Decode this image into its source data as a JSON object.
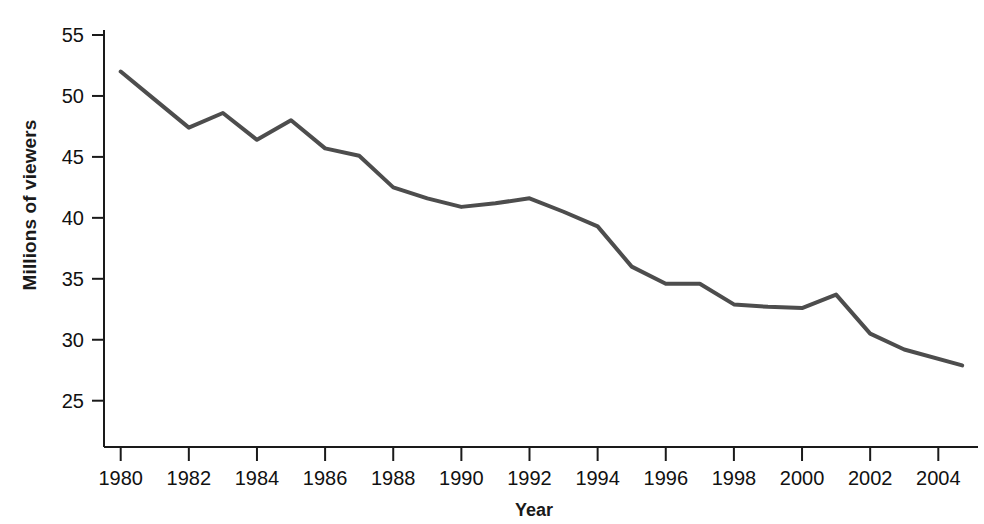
{
  "chart_data": {
    "type": "line",
    "title": "",
    "xlabel": "Year",
    "ylabel": "Millions of viewers",
    "xlim": [
      1979.2,
      2005.2
    ],
    "ylim": [
      22.8,
      56.0
    ],
    "grid": false,
    "legend": null,
    "x_ticks": [
      1980,
      1982,
      1984,
      1986,
      1988,
      1990,
      1992,
      1994,
      1996,
      1998,
      2000,
      2002,
      2004
    ],
    "x_tick_labels": [
      "1980",
      "1982",
      "1984",
      "1986",
      "1988",
      "1990",
      "1992",
      "1994",
      "1996",
      "1998",
      "2000",
      "2002",
      "2004"
    ],
    "y_ticks": [
      25,
      30,
      35,
      40,
      45,
      50,
      55
    ],
    "y_tick_labels": [
      "25",
      "30",
      "35",
      "40",
      "45",
      "50",
      "55"
    ],
    "line_color": "#4d4d4d",
    "line_width": 4,
    "axis_color": "#1a1a1a",
    "series": [
      {
        "name": "Millions of viewers",
        "x": [
          1980,
          1981,
          1982,
          1983,
          1984,
          1985,
          1986,
          1987,
          1988,
          1989,
          1990,
          1991,
          1992,
          1993,
          1994,
          1995,
          1996,
          1997,
          1998,
          1999,
          2000,
          2001,
          2002,
          2003,
          2004.7
        ],
        "values": [
          52.0,
          49.7,
          47.4,
          48.6,
          46.4,
          48.0,
          45.7,
          45.1,
          42.5,
          41.6,
          40.9,
          41.2,
          41.6,
          40.5,
          39.3,
          36.0,
          34.6,
          34.6,
          32.9,
          32.7,
          32.6,
          33.7,
          30.5,
          29.2,
          27.9
        ]
      }
    ]
  }
}
